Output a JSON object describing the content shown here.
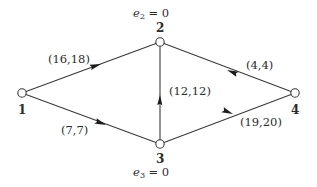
{
  "figure": {
    "background_color": "#ffffff",
    "stroke_color": "#3a3a3a",
    "text_color": "#2b2b2b",
    "node_fill_color": "#ffffff",
    "width": 317,
    "height": 187
  },
  "nodes": [
    {
      "id": "1",
      "label": "1",
      "x": 22,
      "y": 93,
      "label_x": 18,
      "label_y": 104
    },
    {
      "id": "2",
      "label": "2",
      "x": 160,
      "y": 42,
      "label_x": 156,
      "label_y": 22
    },
    {
      "id": "3",
      "label": "3",
      "x": 160,
      "y": 144,
      "label_x": 156,
      "label_y": 153
    },
    {
      "id": "4",
      "label": "4",
      "x": 295,
      "y": 93,
      "label_x": 291,
      "label_y": 104
    }
  ],
  "excess_labels": [
    {
      "id": "e2",
      "symbol": "e",
      "subscript": "2",
      "relation": "=",
      "value": "0",
      "text": "e2 = 0",
      "x": 160,
      "y": 8
    },
    {
      "id": "e3",
      "symbol": "e",
      "subscript": "3",
      "relation": "=",
      "value": "0",
      "text": "e3 = 0",
      "x": 160,
      "y": 167
    }
  ],
  "edges": [
    {
      "id": "edge-2-1",
      "from": "2",
      "to": "1",
      "label": "(16,18)",
      "capacity": 16,
      "flow": 18,
      "label_x": 73,
      "label_y": 56,
      "arrow_direction": "down-left"
    },
    {
      "id": "edge-3-1",
      "from": "3",
      "to": "1",
      "label": "(7,7)",
      "capacity": 7,
      "flow": 7,
      "label_x": 78,
      "label_y": 127,
      "arrow_direction": "up-left"
    },
    {
      "id": "edge-2-3",
      "from": "2",
      "to": "3",
      "label": "(12,12)",
      "capacity": 12,
      "flow": 12,
      "label_x": 193,
      "label_y": 89,
      "arrow_direction": "down"
    },
    {
      "id": "edge-2-4",
      "from": "2",
      "to": "4",
      "label": "(4,4)",
      "capacity": 4,
      "flow": 4,
      "label_x": 259,
      "label_y": 62,
      "arrow_direction": "down-right"
    },
    {
      "id": "edge-4-3",
      "from": "4",
      "to": "3",
      "label": "(19,20)",
      "capacity": 19,
      "flow": 20,
      "label_x": 244,
      "label_y": 119,
      "arrow_direction": "up-left"
    }
  ]
}
